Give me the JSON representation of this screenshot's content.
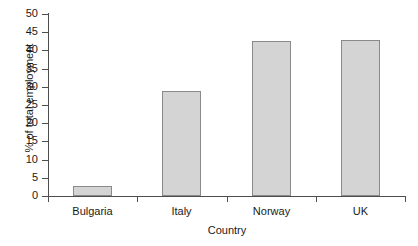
{
  "chart_data": {
    "type": "bar",
    "title": "",
    "xlabel": "Country",
    "ylabel": "% of total employment",
    "categories": [
      "Bulgaria",
      "Italy",
      "Norway",
      "UK"
    ],
    "values": [
      2.7,
      28.8,
      42.6,
      42.8
    ],
    "series": [
      {
        "name": "% of total employment",
        "values": [
          2.7,
          28.8,
          42.6,
          42.8
        ]
      }
    ],
    "ylim": [
      0,
      50
    ],
    "yticks": [
      0,
      5,
      10,
      15,
      20,
      25,
      30,
      35,
      40,
      45,
      50
    ],
    "ytick_labels": [
      "0",
      "5",
      "10",
      "15",
      "20",
      "25",
      "30",
      "35",
      "40",
      "45",
      "50"
    ],
    "grid": false,
    "legend": false,
    "legend_position": "none",
    "bar_fill_color": "#d4d4d4",
    "bar_border_color": "#8a8a8a",
    "axis_color": "#4d4d4d",
    "background_color": "#ffffff"
  }
}
